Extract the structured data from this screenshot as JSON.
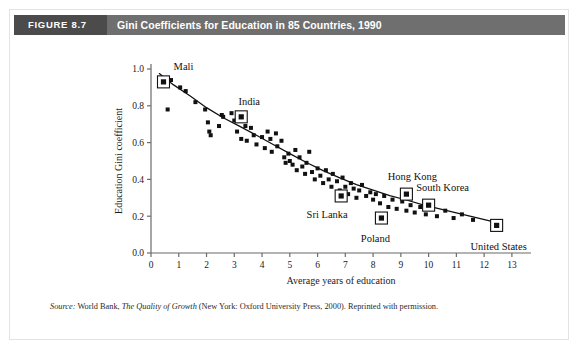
{
  "figure": {
    "number_label": "FIGURE 8.7",
    "title": "Gini Coefficients for Education in 85 Countries, 1990",
    "source_prefix": "Source:",
    "source_publisher": "World Bank,",
    "source_book": "The Quality of Growth",
    "source_rest": "(New York: Oxford University Press, 2000). Reprinted with permission."
  },
  "colors": {
    "header_bar": "#6f6f6f",
    "figure_number_block": "#4b4b4b",
    "header_text": "#ffffff",
    "axis": "#6b6b6b",
    "marker": "#111111",
    "trend_line": "#111111",
    "figure_border": "#e3e3e3",
    "page_background": "#ffffff"
  },
  "chart_data": {
    "type": "scatter",
    "title": "Gini Coefficients for Education in 85 Countries, 1990",
    "xlabel": "Average years of education",
    "ylabel": "Education Gini coefficient",
    "xlim": [
      0,
      13.4
    ],
    "ylim": [
      0.0,
      1.0
    ],
    "xticks": [
      0,
      1,
      2,
      3,
      4,
      5,
      6,
      7,
      8,
      9,
      10,
      11,
      12,
      13
    ],
    "xtick_labels": [
      "0",
      "1",
      "2",
      "3",
      "4",
      "5",
      "6",
      "7",
      "8",
      "9",
      "10",
      "11",
      "12",
      "13"
    ],
    "yticks": [
      0.0,
      0.2,
      0.4,
      0.6,
      0.8,
      1.0
    ],
    "ytick_labels": [
      "0.0",
      "0.2",
      "0.4",
      "0.6",
      "0.8",
      "1.0"
    ],
    "grid": false,
    "legend": "none",
    "series": [
      {
        "name": "Countries",
        "marker": "square",
        "points": [
          [
            0.42,
            0.93
          ],
          [
            0.72,
            0.94
          ],
          [
            0.6,
            0.78
          ],
          [
            1.05,
            0.9
          ],
          [
            1.25,
            0.88
          ],
          [
            1.6,
            0.82
          ],
          [
            1.95,
            0.78
          ],
          [
            2.05,
            0.71
          ],
          [
            2.1,
            0.66
          ],
          [
            2.15,
            0.64
          ],
          [
            2.45,
            0.69
          ],
          [
            2.55,
            0.75
          ],
          [
            2.6,
            0.74
          ],
          [
            2.9,
            0.76
          ],
          [
            3.0,
            0.72
          ],
          [
            3.1,
            0.66
          ],
          [
            3.25,
            0.62
          ],
          [
            3.4,
            0.69
          ],
          [
            3.45,
            0.61
          ],
          [
            3.6,
            0.68
          ],
          [
            3.7,
            0.64
          ],
          [
            3.8,
            0.59
          ],
          [
            4.0,
            0.63
          ],
          [
            4.1,
            0.57
          ],
          [
            4.2,
            0.66
          ],
          [
            4.3,
            0.62
          ],
          [
            4.35,
            0.55
          ],
          [
            4.5,
            0.65
          ],
          [
            4.55,
            0.58
          ],
          [
            4.7,
            0.61
          ],
          [
            4.8,
            0.52
          ],
          [
            4.85,
            0.49
          ],
          [
            4.95,
            0.54
          ],
          [
            5.0,
            0.5
          ],
          [
            5.1,
            0.48
          ],
          [
            5.2,
            0.56
          ],
          [
            5.25,
            0.45
          ],
          [
            5.35,
            0.52
          ],
          [
            5.45,
            0.47
          ],
          [
            5.55,
            0.43
          ],
          [
            5.6,
            0.49
          ],
          [
            5.7,
            0.55
          ],
          [
            5.8,
            0.44
          ],
          [
            5.9,
            0.4
          ],
          [
            6.0,
            0.46
          ],
          [
            6.1,
            0.42
          ],
          [
            6.2,
            0.38
          ],
          [
            6.3,
            0.45
          ],
          [
            6.4,
            0.4
          ],
          [
            6.5,
            0.36
          ],
          [
            6.55,
            0.43
          ],
          [
            6.7,
            0.39
          ],
          [
            6.8,
            0.34
          ],
          [
            6.9,
            0.41
          ],
          [
            7.0,
            0.36
          ],
          [
            7.1,
            0.32
          ],
          [
            7.2,
            0.38
          ],
          [
            7.3,
            0.35
          ],
          [
            7.4,
            0.3
          ],
          [
            7.5,
            0.34
          ],
          [
            7.6,
            0.37
          ],
          [
            7.75,
            0.31
          ],
          [
            7.9,
            0.33
          ],
          [
            8.0,
            0.29
          ],
          [
            8.1,
            0.32
          ],
          [
            8.25,
            0.27
          ],
          [
            8.4,
            0.31
          ],
          [
            8.55,
            0.25
          ],
          [
            8.7,
            0.29
          ],
          [
            8.85,
            0.24
          ],
          [
            9.05,
            0.28
          ],
          [
            9.2,
            0.23
          ],
          [
            9.35,
            0.26
          ],
          [
            9.5,
            0.22
          ],
          [
            9.7,
            0.25
          ],
          [
            9.9,
            0.21
          ],
          [
            10.1,
            0.24
          ],
          [
            10.3,
            0.2
          ],
          [
            10.6,
            0.23
          ],
          [
            10.9,
            0.19
          ],
          [
            11.2,
            0.21
          ],
          [
            11.6,
            0.18
          ]
        ]
      }
    ],
    "highlighted_points": [
      {
        "label": "Mali",
        "x": 0.45,
        "y": 0.93,
        "label_dx": 20,
        "label_dy": -12
      },
      {
        "label": "India",
        "x": 3.25,
        "y": 0.74,
        "label_dx": 8,
        "label_dy": -12
      },
      {
        "label": "Sri Lanka",
        "x": 6.85,
        "y": 0.31,
        "label_dx": -14,
        "label_dy": 22
      },
      {
        "label": "Poland",
        "x": 8.3,
        "y": 0.19,
        "label_dx": -6,
        "label_dy": 24
      },
      {
        "label": "Hong Kong",
        "x": 9.2,
        "y": 0.32,
        "label_dx": 6,
        "label_dy": -14
      },
      {
        "label": "South Korea",
        "x": 10.0,
        "y": 0.26,
        "label_dx": 14,
        "label_dy": -14
      },
      {
        "label": "United States",
        "x": 12.45,
        "y": 0.15,
        "label_dx": 2,
        "label_dy": 25
      }
    ],
    "trend_line": {
      "type": "fitted-curve",
      "points": [
        [
          0.3,
          0.975
        ],
        [
          0.8,
          0.915
        ],
        [
          1.4,
          0.855
        ],
        [
          2.0,
          0.79
        ],
        [
          2.6,
          0.735
        ],
        [
          3.2,
          0.688
        ],
        [
          3.8,
          0.64
        ],
        [
          4.4,
          0.59
        ],
        [
          5.0,
          0.54
        ],
        [
          5.6,
          0.492
        ],
        [
          6.2,
          0.448
        ],
        [
          6.8,
          0.408
        ],
        [
          7.4,
          0.372
        ],
        [
          8.0,
          0.342
        ],
        [
          8.6,
          0.312
        ],
        [
          9.2,
          0.288
        ],
        [
          9.8,
          0.262
        ],
        [
          10.4,
          0.24
        ],
        [
          11.0,
          0.218
        ],
        [
          11.6,
          0.196
        ],
        [
          12.2,
          0.175
        ],
        [
          12.5,
          0.16
        ]
      ]
    }
  }
}
